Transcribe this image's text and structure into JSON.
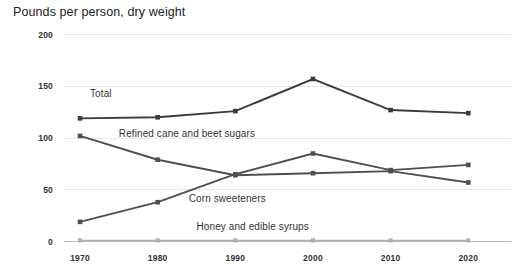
{
  "chart_data": {
    "type": "line",
    "title": "Pounds per person, dry weight",
    "xlabel": "",
    "ylabel": "",
    "categories": [
      "1970",
      "1980",
      "1990",
      "2000",
      "2010",
      "2020"
    ],
    "x": [
      1970,
      1980,
      1990,
      2000,
      2010,
      2020
    ],
    "ylim": [
      0,
      200
    ],
    "yticks": [
      0,
      50,
      100,
      150,
      200
    ],
    "ytick_labels": [
      "0",
      "50",
      "100",
      "150",
      "200"
    ],
    "xtick_labels": [
      "1970",
      "1980",
      "1990",
      "2000",
      "2010",
      "2020"
    ],
    "grid": true,
    "legend_position": "inline-labels",
    "series": [
      {
        "name": "Total",
        "label": "Total",
        "color": "#3b3b3b",
        "values": [
          119,
          120,
          126,
          157,
          127,
          124
        ],
        "label_x": 1970,
        "label_y": 139
      },
      {
        "name": "Refined cane and beet sugars",
        "label": "Refined cane and beet sugars",
        "color": "#4f4f4f",
        "values": [
          102,
          79,
          64,
          66,
          68,
          57
        ],
        "label_x": 1975,
        "label_y": 101
      },
      {
        "name": "Corn sweeteners",
        "label": "Corn sweeteners",
        "color": "#4f4f4f",
        "values": [
          19,
          38,
          65,
          85,
          69,
          74
        ],
        "label_x": 1984,
        "label_y": 38
      },
      {
        "name": "Honey and edible syrups",
        "label": "Honey and edible syrups",
        "color": "#b0b0b0",
        "values": [
          1,
          1,
          1,
          1,
          1,
          1
        ],
        "label_x": 1985,
        "label_y": 11
      }
    ]
  },
  "colors": {
    "background": "#ffffff",
    "grid": "#e8e8e8",
    "axis": "#bcbcbc",
    "text": "#333333",
    "title": "#222222",
    "series_dark": "#3b3b3b",
    "series_mid": "#4f4f4f",
    "series_light": "#b0b0b0"
  }
}
